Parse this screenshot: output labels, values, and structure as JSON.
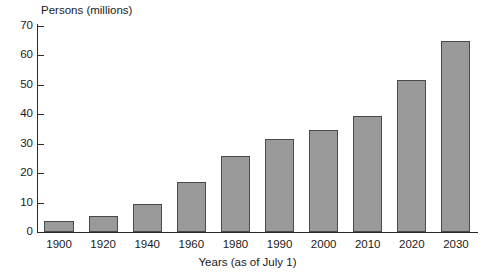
{
  "chart_data": {
    "type": "bar",
    "title": "",
    "subtitle": "",
    "ylabel": "Persons (millions)",
    "xlabel": "Years (as of July 1)",
    "categories": [
      "1900",
      "1920",
      "1940",
      "1960",
      "1980",
      "1990",
      "2000",
      "2010",
      "2020",
      "2030"
    ],
    "values": [
      3.7,
      5.6,
      9.4,
      17.0,
      25.8,
      31.5,
      34.5,
      39.5,
      51.5,
      65.0
    ],
    "ylim": [
      0,
      70
    ],
    "y_ticks": [
      70,
      60,
      50,
      40,
      30,
      20,
      10,
      0
    ],
    "y_tick_labels": [
      "70",
      "60",
      "50",
      "40",
      "30",
      "20",
      "10",
      "0"
    ],
    "grid": false,
    "legend": "none",
    "bar_fill_color": "#9a9a9a",
    "bar_edge_color": "#4a4a4a",
    "axis_color": "#2b2b2b",
    "background_color": "#ffffff"
  }
}
